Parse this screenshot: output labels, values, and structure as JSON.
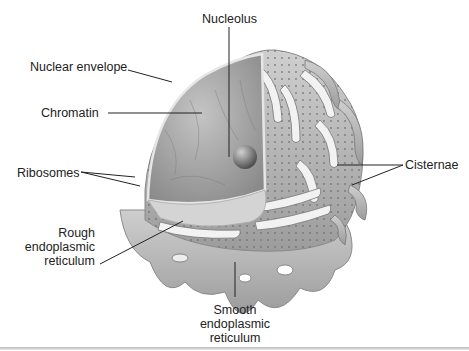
{
  "figure": {
    "labels": {
      "nucleolus": "Nucleolus",
      "nuclear_envelope": "Nuclear envelope",
      "chromatin": "Chromatin",
      "ribosomes": "Ribosomes",
      "cisternae": "Cisternae",
      "rough_er": [
        "Rough",
        "endoplasmic",
        "reticulum"
      ],
      "smooth_er": [
        "Smooth",
        "endoplasmic",
        "reticulum"
      ]
    },
    "colors": {
      "background": "#ffffff",
      "membrane": "#b8b8b8",
      "membrane_light": "#dcdcdc",
      "nucleus": "#9a9a9a",
      "leader_line": "#222222"
    }
  }
}
